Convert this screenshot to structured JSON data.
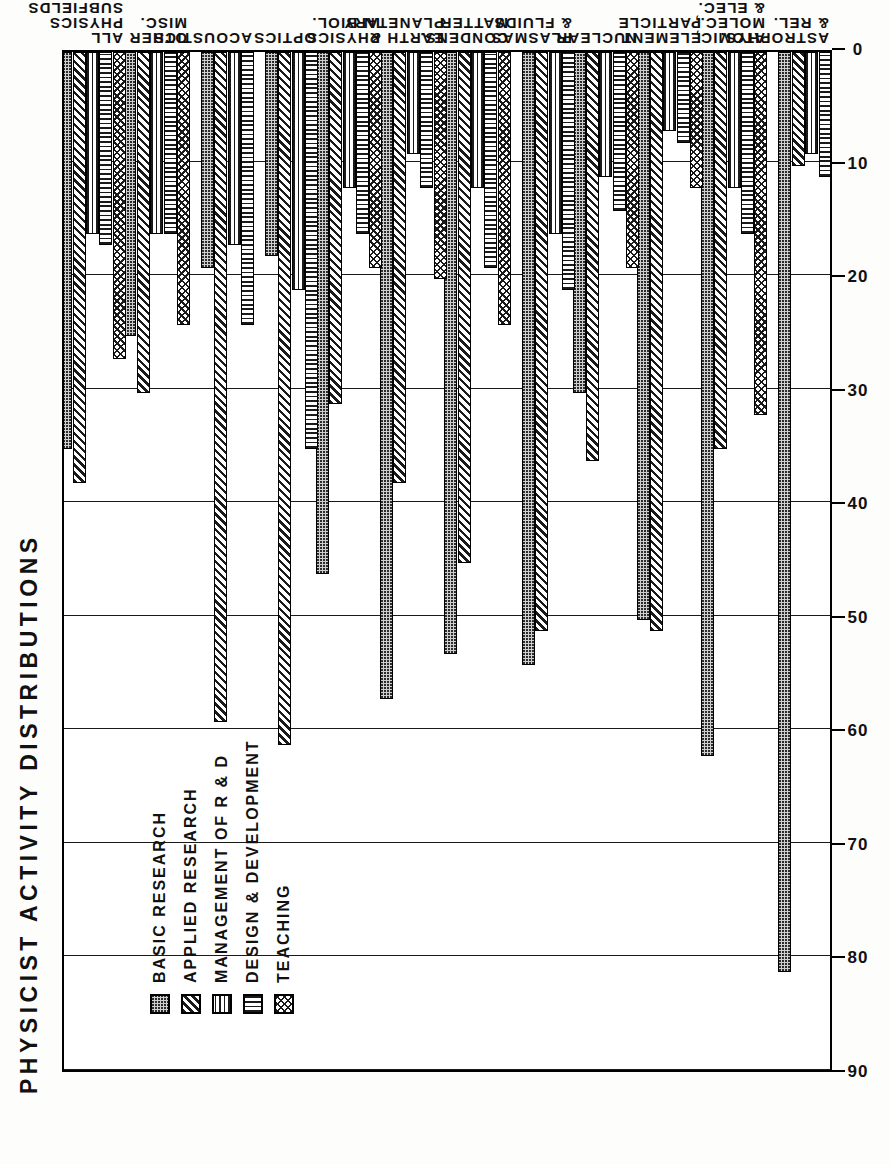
{
  "title": "PHYSICIST ACTIVITY DISTRIBUTIONS",
  "axis": {
    "y_name": "PERCENT",
    "tick_labels": [
      "0",
      "10",
      "20",
      "30",
      "40",
      "50",
      "60",
      "70",
      "80",
      "90"
    ]
  },
  "legend": {
    "items": [
      {
        "label": "BASIC RESEARCH",
        "pattern": "stipple-dots",
        "key": "basic"
      },
      {
        "label": "APPLIED RESEARCH",
        "pattern": "diagonal-hatch",
        "key": "applied"
      },
      {
        "label": "MANAGEMENT OF R & D",
        "pattern": "horizontal-lines",
        "key": "mgmt"
      },
      {
        "label": "DESIGN & DEVELOPMENT",
        "pattern": "vertical-lines",
        "key": "design"
      },
      {
        "label": "TEACHING",
        "pattern": "cross-hatch",
        "key": "teaching"
      }
    ]
  },
  "chart_data": {
    "type": "bar",
    "orientation": "horizontal",
    "title": "PHYSICIST ACTIVITY DISTRIBUTIONS",
    "xlabel": "",
    "ylabel": "PERCENT",
    "ylim": [
      0,
      90
    ],
    "grid": true,
    "legend_position": "upper-left-inside",
    "categories": [
      "ASTROPHYS.\n& REL.",
      "ATOMIC,\nMOLEC.,\n& ELEC.",
      "ELEMENT.\nPARTICLE",
      "NUCLEAR",
      "PLASMAS\n& FLUIDS",
      "CONDENS.\nMATTER",
      "EARTH &\nPLANETARY",
      "PHYSICS\nIN BIOL.",
      "OPTICS",
      "ACOUSTICS",
      "OTHER\nMISC.",
      "ALL\nPHYSICS\nSUBFIELDS"
    ],
    "series": [
      {
        "name": "BASIC RESEARCH",
        "values": [
          81,
          62,
          50,
          30,
          54,
          53,
          57,
          46,
          18,
          19,
          25,
          35
        ]
      },
      {
        "name": "APPLIED RESEARCH",
        "values": [
          10,
          35,
          51,
          36,
          51,
          45,
          38,
          31,
          61,
          59,
          30,
          38
        ]
      },
      {
        "name": "MANAGEMENT OF R & D",
        "values": [
          9,
          12,
          7,
          11,
          16,
          12,
          9,
          12,
          21,
          17,
          16,
          16
        ]
      },
      {
        "name": "DESIGN & DEVELOPMENT",
        "values": [
          11,
          16,
          8,
          14,
          21,
          19,
          12,
          16,
          35,
          24,
          16,
          17
        ]
      },
      {
        "name": "TEACHING",
        "values": [
          0,
          32,
          12,
          19,
          0,
          24,
          20,
          19,
          0,
          0,
          24,
          27
        ]
      }
    ]
  }
}
